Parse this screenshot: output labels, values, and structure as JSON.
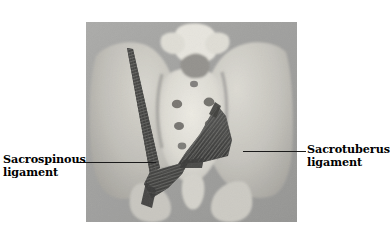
{
  "figure": {
    "kind": "anatomical-photograph",
    "background_color": "#ffffff",
    "photo": {
      "x": 86,
      "y": 22,
      "width": 211,
      "height": 200,
      "base_tone": "#9a9a9a",
      "bone_tone": "#d8d6cf",
      "shadow_tone": "#6c6c6c"
    },
    "labels": [
      {
        "id": "sacrospinous",
        "line1": "Sacrospinous",
        "line2": "ligament",
        "side": "left",
        "text_x": 3,
        "text_y": 153,
        "leader": {
          "x1": 77,
          "y1": 162,
          "x2": 156,
          "y2": 162
        }
      },
      {
        "id": "sacrotuberus",
        "line1": "Sacrotuberus",
        "line2": "ligament",
        "side": "right",
        "text_x": 307,
        "text_y": 143,
        "leader": {
          "x1": 243,
          "y1": 151,
          "x2": 306,
          "y2": 151
        }
      }
    ],
    "structures": [
      {
        "name": "sacrospinous-ligament",
        "color": "#3a3a3a",
        "description": "long dark striated fibrous band fanning into a triangle on the left side"
      },
      {
        "name": "sacrotuberus-ligament",
        "color": "#3a3a3a",
        "description": "dark triangular striated fan on the right side"
      },
      {
        "name": "sacrum",
        "color": "#dedcd4"
      },
      {
        "name": "lumbar-vertebra",
        "color": "#e2e0d8"
      },
      {
        "name": "left-ilium",
        "color": "#cfcdc6"
      },
      {
        "name": "right-ilium",
        "color": "#cfcdc6"
      },
      {
        "name": "coccyx",
        "color": "#d4d2ca"
      },
      {
        "name": "ischial-tuberosity",
        "color": "#c9c7c0"
      }
    ]
  }
}
